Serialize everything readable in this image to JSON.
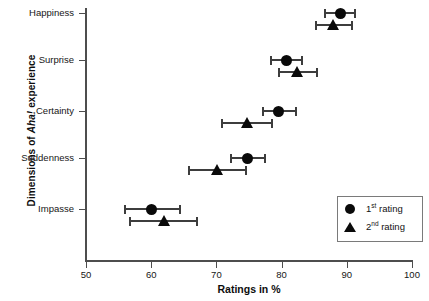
{
  "chart_data": {
    "type": "scatter",
    "title": "",
    "xlabel": "Ratings in %",
    "ylabel": "Dimensions of Aha! experience",
    "ylabel_plain": "Dimensions of ",
    "ylabel_italic": "Aha!",
    "ylabel_tail": " experience",
    "xlim": [
      50,
      100
    ],
    "xticks": [
      50,
      60,
      70,
      80,
      90,
      100
    ],
    "xtick_labels": [
      "50",
      "60",
      "70",
      "80",
      "90",
      "100"
    ],
    "categories": [
      "Happiness",
      "Surprise",
      "Certainty",
      "Suddenness",
      "Impasse"
    ],
    "grid": false,
    "legend_position": "bottom-right",
    "series": [
      {
        "name": "1st rating",
        "label_number": "1",
        "label_ordinal": "st",
        "label_tail": " rating",
        "marker": "circle",
        "color": "#0a0a0a",
        "values": [
          89.0,
          80.7,
          79.6,
          74.8,
          60.1
        ],
        "error_low": [
          86.7,
          78.3,
          77.1,
          72.3,
          56.0
        ],
        "error_high": [
          91.3,
          83.2,
          82.2,
          77.5,
          64.4
        ]
      },
      {
        "name": "2nd rating",
        "label_number": "2",
        "label_ordinal": "nd",
        "label_tail": " rating",
        "marker": "triangle",
        "color": "#0a0a0a",
        "values": [
          88.0,
          82.5,
          74.8,
          70.2,
          62.0
        ],
        "error_low": [
          85.2,
          79.6,
          70.9,
          65.8,
          56.8
        ],
        "error_high": [
          90.8,
          85.4,
          78.6,
          74.6,
          67.1
        ]
      }
    ]
  },
  "axis": {
    "x_title": "Ratings in %",
    "x_tick_labels": [
      "50",
      "60",
      "70",
      "80",
      "90",
      "100"
    ],
    "y_tick_labels": [
      "Happiness",
      "Surprise",
      "Certainty",
      "Suddenness",
      "Impasse"
    ]
  },
  "legend": {
    "items": [
      {
        "symbol": "circle",
        "number": "1",
        "ordinal": "st",
        "tail": " rating"
      },
      {
        "symbol": "triangle",
        "number": "2",
        "ordinal": "nd",
        "tail": " rating"
      }
    ]
  },
  "colors": {
    "marker": "#0a0a0a",
    "axis": "#4d4d4d",
    "errorbar": "#3d3d3d",
    "legend_border": "#7a7a7a",
    "background": "#ffffff"
  }
}
